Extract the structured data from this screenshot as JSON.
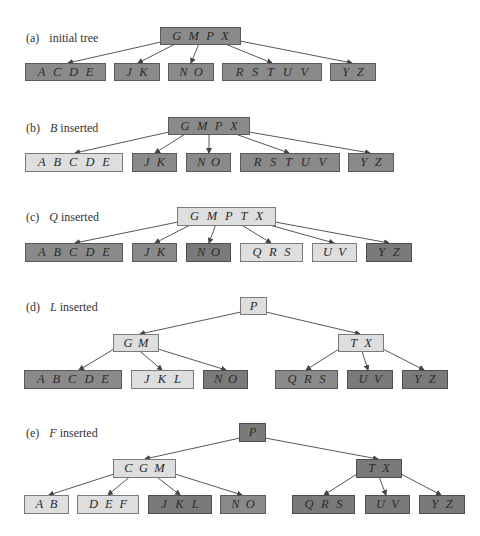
{
  "colors": {
    "dark": "#8a8a8a",
    "light": "#dedede",
    "edge": "#444444"
  },
  "panels": [
    {
      "id": "a",
      "tag": "(a)",
      "caption_key": "",
      "caption_rest": "initial tree",
      "label_pos": [
        26,
        31
      ],
      "nodes": [
        {
          "id": "root",
          "keys": [
            "G",
            "M",
            "P",
            "X"
          ],
          "shade": "dark",
          "box": [
            160,
            27,
            81,
            18
          ]
        },
        {
          "id": "l1",
          "keys": [
            "A",
            "C",
            "D",
            "E"
          ],
          "shade": "dark",
          "box": [
            25,
            63,
            81,
            18
          ]
        },
        {
          "id": "l2",
          "keys": [
            "J",
            "K"
          ],
          "shade": "dark",
          "box": [
            114,
            63,
            46,
            18
          ]
        },
        {
          "id": "l3",
          "keys": [
            "N",
            "O"
          ],
          "shade": "dark",
          "box": [
            168,
            63,
            46,
            18
          ]
        },
        {
          "id": "l4",
          "keys": [
            "R",
            "S",
            "T",
            "U",
            "V"
          ],
          "shade": "dark",
          "box": [
            222,
            63,
            100,
            18
          ]
        },
        {
          "id": "l5",
          "keys": [
            "Y",
            "Z"
          ],
          "shade": "dark",
          "box": [
            330,
            63,
            46,
            18
          ]
        }
      ],
      "edges": [
        {
          "from": [
            161,
            42
          ],
          "to": [
            68,
            63
          ]
        },
        {
          "from": [
            181,
            41
          ],
          "to": [
            138,
            63
          ]
        },
        {
          "from": [
            200,
            41
          ],
          "to": [
            191,
            63
          ]
        },
        {
          "from": [
            218,
            41
          ],
          "to": [
            272,
            63
          ]
        },
        {
          "from": [
            240,
            41
          ],
          "to": [
            352,
            63
          ]
        }
      ]
    },
    {
      "id": "b",
      "tag": "(b)",
      "caption_key": "B",
      "caption_rest": " inserted",
      "label_pos": [
        26,
        121
      ],
      "nodes": [
        {
          "id": "root",
          "keys": [
            "G",
            "M",
            "P",
            "X"
          ],
          "shade": "dark",
          "box": [
            168,
            117,
            82,
            18
          ]
        },
        {
          "id": "l1",
          "keys": [
            "A",
            "B",
            "C",
            "D",
            "E"
          ],
          "shade": "light",
          "box": [
            25,
            153,
            98,
            19
          ]
        },
        {
          "id": "l2",
          "keys": [
            "J",
            "K"
          ],
          "shade": "dark",
          "box": [
            132,
            153,
            45,
            19
          ]
        },
        {
          "id": "l3",
          "keys": [
            "N",
            "O"
          ],
          "shade": "dark",
          "box": [
            186,
            153,
            45,
            19
          ]
        },
        {
          "id": "l4",
          "keys": [
            "R",
            "S",
            "T",
            "U",
            "V"
          ],
          "shade": "dark",
          "box": [
            240,
            153,
            100,
            19
          ]
        },
        {
          "id": "l5",
          "keys": [
            "Y",
            "Z"
          ],
          "shade": "dark",
          "box": [
            348,
            153,
            46,
            19
          ]
        }
      ],
      "edges": [
        {
          "from": [
            169,
            132
          ],
          "to": [
            75,
            153
          ]
        },
        {
          "from": [
            190,
            131
          ],
          "to": [
            155,
            153
          ]
        },
        {
          "from": [
            209,
            131
          ],
          "to": [
            209,
            153
          ]
        },
        {
          "from": [
            227,
            131
          ],
          "to": [
            289,
            153
          ]
        },
        {
          "from": [
            249,
            132
          ],
          "to": [
            370,
            153
          ]
        }
      ]
    },
    {
      "id": "c",
      "tag": "(c)",
      "caption_key": "Q",
      "caption_rest": " inserted",
      "label_pos": [
        26,
        210
      ],
      "nodes": [
        {
          "id": "root",
          "keys": [
            "G",
            "M",
            "P",
            "T",
            "X"
          ],
          "shade": "light",
          "box": [
            177,
            207,
            99,
            19
          ]
        },
        {
          "id": "l1",
          "keys": [
            "A",
            "B",
            "C",
            "D",
            "E"
          ],
          "shade": "dark",
          "box": [
            25,
            243,
            98,
            19
          ]
        },
        {
          "id": "l2",
          "keys": [
            "J",
            "K"
          ],
          "shade": "dark",
          "box": [
            132,
            243,
            45,
            19
          ]
        },
        {
          "id": "l3",
          "keys": [
            "N",
            "O"
          ],
          "shade": "darker",
          "box": [
            186,
            243,
            45,
            19
          ]
        },
        {
          "id": "l4",
          "keys": [
            "Q",
            "R",
            "S"
          ],
          "shade": "light",
          "box": [
            240,
            243,
            63,
            19
          ]
        },
        {
          "id": "l5",
          "keys": [
            "U",
            "V"
          ],
          "shade": "light",
          "box": [
            312,
            243,
            45,
            19
          ]
        },
        {
          "id": "l6",
          "keys": [
            "Y",
            "Z"
          ],
          "shade": "darker",
          "box": [
            366,
            243,
            46,
            19
          ]
        }
      ],
      "edges": [
        {
          "from": [
            178,
            222
          ],
          "to": [
            75,
            243
          ]
        },
        {
          "from": [
            198,
            221
          ],
          "to": [
            155,
            243
          ]
        },
        {
          "from": [
            217,
            221
          ],
          "to": [
            209,
            243
          ]
        },
        {
          "from": [
            235,
            221
          ],
          "to": [
            271,
            243
          ]
        },
        {
          "from": [
            255,
            221
          ],
          "to": [
            334,
            243
          ]
        },
        {
          "from": [
            275,
            222
          ],
          "to": [
            389,
            243
          ]
        }
      ]
    },
    {
      "id": "d",
      "tag": "(d)",
      "caption_key": "L",
      "caption_rest": " inserted",
      "label_pos": [
        26,
        300
      ],
      "nodes": [
        {
          "id": "root",
          "keys": [
            "P"
          ],
          "shade": "light",
          "box": [
            240,
            297,
            27,
            18
          ]
        },
        {
          "id": "m1",
          "keys": [
            "G",
            "M"
          ],
          "shade": "light",
          "box": [
            113,
            334,
            46,
            18
          ]
        },
        {
          "id": "m2",
          "keys": [
            "T",
            "X"
          ],
          "shade": "light",
          "box": [
            338,
            334,
            46,
            18
          ]
        },
        {
          "id": "l1",
          "keys": [
            "A",
            "B",
            "C",
            "D",
            "E"
          ],
          "shade": "dark",
          "box": [
            24,
            370,
            98,
            19
          ]
        },
        {
          "id": "l2",
          "keys": [
            "J",
            "K",
            "L"
          ],
          "shade": "light",
          "box": [
            131,
            370,
            63,
            19
          ]
        },
        {
          "id": "l3",
          "keys": [
            "N",
            "O"
          ],
          "shade": "darker",
          "box": [
            203,
            370,
            45,
            19
          ]
        },
        {
          "id": "l4",
          "keys": [
            "Q",
            "R",
            "S"
          ],
          "shade": "dark",
          "box": [
            275,
            370,
            63,
            19
          ]
        },
        {
          "id": "l5",
          "keys": [
            "U",
            "V"
          ],
          "shade": "darker",
          "box": [
            347,
            370,
            46,
            19
          ]
        },
        {
          "id": "l6",
          "keys": [
            "Y",
            "Z"
          ],
          "shade": "darker",
          "box": [
            402,
            370,
            46,
            19
          ]
        }
      ],
      "edges": [
        {
          "from": [
            241,
            312
          ],
          "to": [
            140,
            334
          ]
        },
        {
          "from": [
            266,
            312
          ],
          "to": [
            360,
            334
          ]
        },
        {
          "from": [
            114,
            349
          ],
          "to": [
            79,
            370
          ]
        },
        {
          "from": [
            136,
            348
          ],
          "to": [
            162,
            370
          ]
        },
        {
          "from": [
            158,
            349
          ],
          "to": [
            226,
            370
          ]
        },
        {
          "from": [
            339,
            349
          ],
          "to": [
            306,
            370
          ]
        },
        {
          "from": [
            361,
            348
          ],
          "to": [
            368,
            370
          ]
        },
        {
          "from": [
            383,
            349
          ],
          "to": [
            424,
            370
          ]
        }
      ]
    },
    {
      "id": "e",
      "tag": "(e)",
      "caption_key": "F",
      "caption_rest": " inserted",
      "label_pos": [
        26,
        426
      ],
      "nodes": [
        {
          "id": "root",
          "keys": [
            "P"
          ],
          "shade": "darker",
          "box": [
            239,
            423,
            27,
            19
          ]
        },
        {
          "id": "m1",
          "keys": [
            "C",
            "G",
            "M"
          ],
          "shade": "light",
          "box": [
            113,
            459,
            63,
            19
          ]
        },
        {
          "id": "m2",
          "keys": [
            "T",
            "X"
          ],
          "shade": "darker",
          "box": [
            356,
            459,
            46,
            19
          ]
        },
        {
          "id": "l1",
          "keys": [
            "A",
            "B"
          ],
          "shade": "light",
          "box": [
            24,
            495,
            45,
            19
          ]
        },
        {
          "id": "l2",
          "keys": [
            "D",
            "E",
            "F"
          ],
          "shade": "light",
          "box": [
            77,
            495,
            62,
            19
          ]
        },
        {
          "id": "l3",
          "keys": [
            "J",
            "K",
            "L"
          ],
          "shade": "darker",
          "box": [
            148,
            495,
            64,
            19
          ]
        },
        {
          "id": "l4",
          "keys": [
            "N",
            "O"
          ],
          "shade": "dark",
          "box": [
            220,
            495,
            46,
            19
          ]
        },
        {
          "id": "l5",
          "keys": [
            "Q",
            "R",
            "S"
          ],
          "shade": "darker",
          "box": [
            292,
            495,
            63,
            19
          ]
        },
        {
          "id": "l6",
          "keys": [
            "U",
            "V"
          ],
          "shade": "darker",
          "box": [
            365,
            495,
            45,
            19
          ]
        },
        {
          "id": "l7",
          "keys": [
            "Y",
            "Z"
          ],
          "shade": "darker",
          "box": [
            419,
            495,
            46,
            19
          ]
        }
      ],
      "edges": [
        {
          "from": [
            240,
            438
          ],
          "to": [
            145,
            459
          ]
        },
        {
          "from": [
            265,
            438
          ],
          "to": [
            378,
            459
          ]
        },
        {
          "from": [
            114,
            474
          ],
          "to": [
            49,
            495
          ]
        },
        {
          "from": [
            133,
            474
          ],
          "to": [
            108,
            495
          ]
        },
        {
          "from": [
            153,
            474
          ],
          "to": [
            180,
            495
          ]
        },
        {
          "from": [
            175,
            474
          ],
          "to": [
            242,
            495
          ]
        },
        {
          "from": [
            357,
            474
          ],
          "to": [
            324,
            495
          ]
        },
        {
          "from": [
            378,
            474
          ],
          "to": [
            386,
            495
          ]
        },
        {
          "from": [
            401,
            474
          ],
          "to": [
            441,
            495
          ]
        }
      ]
    }
  ]
}
